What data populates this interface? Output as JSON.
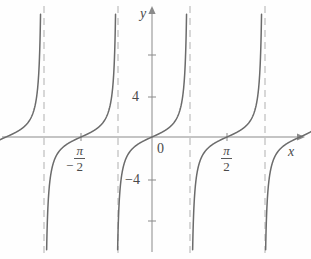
{
  "figure": {
    "name": "tangent-function-graph",
    "background_color": "#fefefe",
    "curve_color": "#6b6b6b",
    "axis_color": "#8a8a8a",
    "asymptote_color": "#b0b0b0",
    "text_color": "#4a4a4a"
  },
  "labels": {
    "y_axis": "y",
    "x_axis": "x",
    "origin": "0",
    "y_tick_positive_4": "4",
    "y_tick_negative_4": "−4",
    "x_tick_neg_pi_over_2": {
      "sign": "−",
      "numerator": "π",
      "denominator": "2"
    },
    "x_tick_pi_over_2": {
      "sign": "",
      "numerator": "π",
      "denominator": "2"
    }
  },
  "chart_data": {
    "type": "line",
    "title": "",
    "subtitle": "",
    "function": "y = tan(x)",
    "xlabel": "x",
    "ylabel": "y",
    "xlim": [
      -4.9,
      2.0
    ],
    "ylim": [
      -9.2,
      9.2
    ],
    "grid": false,
    "legend": null,
    "legend_position": "none",
    "x_ticks": [
      {
        "value": -1.5708,
        "label": "-π/2",
        "pixel_x": 81
      },
      {
        "value": 1.5708,
        "label": "π/2",
        "pixel_x": 227
      }
    ],
    "y_ticks": [
      {
        "value": 8,
        "label": "",
        "pixel_y": 55
      },
      {
        "value": 4,
        "label": "4",
        "pixel_y": 97
      },
      {
        "value": 0,
        "label": "0",
        "pixel_y": 137
      },
      {
        "value": -4,
        "label": "−4",
        "pixel_y": 180
      },
      {
        "value": -8,
        "label": "",
        "pixel_y": 221
      }
    ],
    "origin_pixel": [
      152,
      137
    ],
    "x_pixels_per_pi": 73,
    "y_pixels_per_unit": 10.4,
    "asymptotes": [
      {
        "x_value": -4.7124,
        "pixel_x": 44
      },
      {
        "x_value": -3.1416,
        "pixel_x": 118
      },
      {
        "x_value": -1.5708,
        "pixel_x": 190
      },
      {
        "x_value": 1.5708,
        "pixel_x": 265
      }
    ],
    "zero_crossings": [
      {
        "x_value": -3.927,
        "pixel_x": 6
      },
      {
        "x_value": -2.356,
        "pixel_x": 81
      },
      {
        "x_value": 0.0,
        "pixel_x": 152
      },
      {
        "x_value": 1.571,
        "pixel_x": 227
      }
    ],
    "series": [
      {
        "name": "y = tan(x)",
        "color": "#6b6b6b",
        "style": "solid",
        "branches": [
          {
            "center_pixel_x": 6,
            "visible_from_pixel_x": 0,
            "visible_to_pixel_x": 44
          },
          {
            "center_pixel_x": 81,
            "visible_from_pixel_x": 44,
            "visible_to_pixel_x": 118
          },
          {
            "center_pixel_x": 152,
            "visible_from_pixel_x": 118,
            "visible_to_pixel_x": 190
          },
          {
            "center_pixel_x": 227,
            "visible_from_pixel_x": 190,
            "visible_to_pixel_x": 265
          },
          {
            "center_pixel_x": 300,
            "visible_from_pixel_x": 265,
            "visible_to_pixel_x": 311
          }
        ]
      }
    ]
  }
}
